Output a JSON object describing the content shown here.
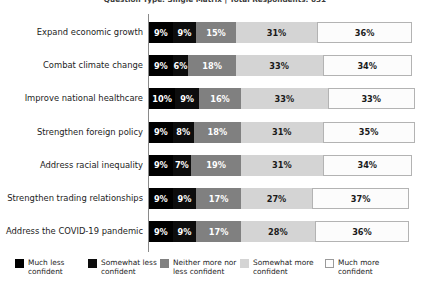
{
  "chart_data": {
    "type": "bar",
    "orientation": "horizontal",
    "stacked": true,
    "normalized_percent": true,
    "title": "Question Type: Single Matrix | Total Respondents: 651",
    "xlabel": "",
    "ylabel": "",
    "xlim": [
      0,
      100
    ],
    "grid": false,
    "legend_position": "bottom",
    "value_suffix": "%",
    "categories": [
      "Expand economic growth",
      "Combat climate change",
      "Improve national healthcare",
      "Strengthen foreign policy",
      "Address racial inequality",
      "Strengthen trading relationships",
      "Address the COVID-19 pandemic"
    ],
    "series": [
      {
        "name": "Much less confident",
        "color": "#000000",
        "values": [
          9,
          9,
          10,
          9,
          9,
          9,
          9
        ],
        "labels": [
          "9%",
          "9%",
          "10%",
          "9%",
          "9%",
          "9%",
          "9%"
        ]
      },
      {
        "name": "Somewhat less confident",
        "color": "#0d0d0d",
        "values": [
          9,
          6,
          9,
          8,
          7,
          9,
          9
        ],
        "labels": [
          "9%",
          "6%",
          "9%",
          "8%",
          "7%",
          "9%",
          "9%"
        ]
      },
      {
        "name": "Neither more nor less confident",
        "color": "#808080",
        "values": [
          15,
          18,
          16,
          18,
          19,
          17,
          17
        ],
        "labels": [
          "15%",
          "18%",
          "16%",
          "18%",
          "19%",
          "17%",
          "17%"
        ]
      },
      {
        "name": "Somewhat more confident",
        "color": "#d4d4d4",
        "values": [
          31,
          33,
          33,
          31,
          31,
          27,
          28
        ],
        "labels": [
          "31%",
          "33%",
          "33%",
          "31%",
          "31%",
          "27%",
          "28%"
        ]
      },
      {
        "name": "Much more confident",
        "color": "#fcfcfc",
        "values": [
          36,
          34,
          33,
          35,
          34,
          37,
          36
        ],
        "labels": [
          "36%",
          "34%",
          "33%",
          "35%",
          "34%",
          "37%",
          "36%"
        ]
      }
    ],
    "legend": [
      {
        "label_line1": "Much less",
        "label_line2": "confident",
        "swatch": "#000000"
      },
      {
        "label_line1": "Somewhat less",
        "label_line2": "confident",
        "swatch": "#0d0d0d"
      },
      {
        "label_line1": "Neither more nor",
        "label_line2": "less confident",
        "swatch": "#808080"
      },
      {
        "label_line1": "Somewhat more",
        "label_line2": "confident",
        "swatch": "#d4d4d4"
      },
      {
        "label_line1": "Much more",
        "label_line2": "confident",
        "swatch": "#fcfcfc"
      }
    ]
  }
}
